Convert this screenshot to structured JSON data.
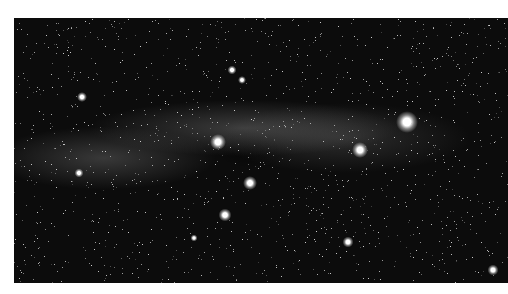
{
  "image": {
    "subject": "Milky Way star field",
    "description": "Black-and-white astrophotograph of a dense star field along the Milky Way band with several bright stars",
    "colors": {
      "background": "#0c0c0c",
      "stars": "#ffffff",
      "margin": "#ffffff"
    },
    "bright_stars": [
      {
        "x": 393,
        "y": 104,
        "size": 22
      },
      {
        "x": 346,
        "y": 132,
        "size": 16
      },
      {
        "x": 204,
        "y": 124,
        "size": 16
      },
      {
        "x": 236,
        "y": 165,
        "size": 14
      },
      {
        "x": 211,
        "y": 197,
        "size": 13
      },
      {
        "x": 334,
        "y": 224,
        "size": 11
      },
      {
        "x": 479,
        "y": 252,
        "size": 11
      },
      {
        "x": 68,
        "y": 79,
        "size": 10
      },
      {
        "x": 218,
        "y": 52,
        "size": 9
      },
      {
        "x": 228,
        "y": 62,
        "size": 8
      },
      {
        "x": 180,
        "y": 220,
        "size": 7
      },
      {
        "x": 65,
        "y": 155,
        "size": 9
      }
    ]
  }
}
